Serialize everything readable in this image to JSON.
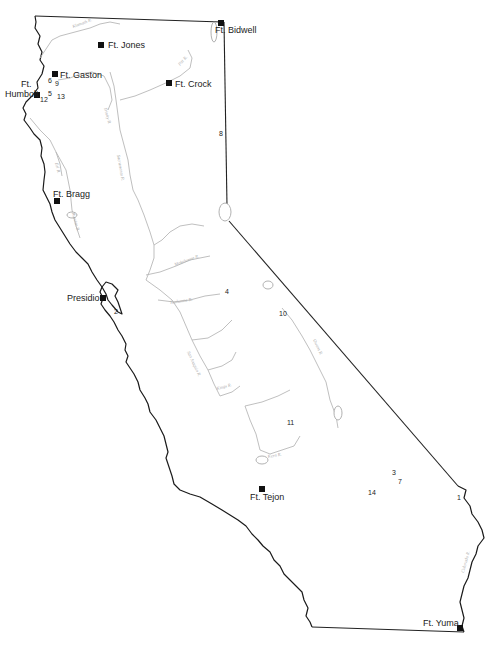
{
  "map": {
    "title": "California forts and sites",
    "colors": {
      "border": "#222222",
      "river": "#b8b8b8",
      "marker": "#111111",
      "background": "#ffffff"
    },
    "forts": [
      {
        "id": "ft-bidwell",
        "label": "Ft. Bidwell",
        "x": 221,
        "y": 23,
        "lx": 215,
        "ly": 33
      },
      {
        "id": "ft-jones",
        "label": "Ft. Jones",
        "x": 101,
        "y": 45,
        "lx": 108,
        "ly": 48
      },
      {
        "id": "ft-gaston",
        "label": "Ft. Gaston",
        "x": 55,
        "y": 74,
        "lx": 60,
        "ly": 78
      },
      {
        "id": "ft-crock",
        "label": "Ft. Crock",
        "x": 169,
        "y": 83,
        "lx": 175,
        "ly": 87
      },
      {
        "id": "ft-humbolt",
        "label_line1": "Ft.",
        "label_line2": "Humbolt",
        "x": 37,
        "y": 95,
        "lx": 5,
        "ly": 87
      },
      {
        "id": "ft-bragg",
        "label": "Ft. Bragg",
        "x": 57,
        "y": 201,
        "lx": 53,
        "ly": 197
      },
      {
        "id": "presidio",
        "label": "Presidio",
        "x": 103,
        "y": 298,
        "lx": 67,
        "ly": 301
      },
      {
        "id": "ft-tejon",
        "label": "Ft. Tejon",
        "x": 262,
        "y": 489,
        "lx": 250,
        "ly": 500
      },
      {
        "id": "ft-yuma",
        "label": "Ft. Yuma",
        "x": 460,
        "y": 628,
        "lx": 423,
        "ly": 626
      }
    ],
    "sites": [
      {
        "n": "1",
        "x": 457,
        "y": 500
      },
      {
        "n": "2",
        "x": 114,
        "y": 314
      },
      {
        "n": "3",
        "x": 392,
        "y": 475
      },
      {
        "n": "4",
        "x": 225,
        "y": 294
      },
      {
        "n": "5",
        "x": 48,
        "y": 96
      },
      {
        "n": "6",
        "x": 48,
        "y": 83
      },
      {
        "n": "7",
        "x": 398,
        "y": 484
      },
      {
        "n": "8",
        "x": 219,
        "y": 136
      },
      {
        "n": "9",
        "x": 55,
        "y": 86
      },
      {
        "n": "10",
        "x": 279,
        "y": 316
      },
      {
        "n": "11",
        "x": 287,
        "y": 425
      },
      {
        "n": "12",
        "x": 40,
        "y": 102
      },
      {
        "n": "13",
        "x": 57,
        "y": 99
      },
      {
        "n": "14",
        "x": 368,
        "y": 495
      }
    ],
    "rivers": [
      {
        "label": "Klamath R.",
        "x": 73,
        "y": 28,
        "rot": -20
      },
      {
        "label": "Pitt R.",
        "x": 180,
        "y": 66,
        "rot": -50
      },
      {
        "label": "Trinity R.",
        "x": 104,
        "y": 108,
        "rot": 75
      },
      {
        "label": "Eel R.",
        "x": 55,
        "y": 163,
        "rot": 75
      },
      {
        "label": "Russian R.",
        "x": 72,
        "y": 213,
        "rot": 75
      },
      {
        "label": "Sacramento R.",
        "x": 117,
        "y": 155,
        "rot": 80
      },
      {
        "label": "Mokelumne R.",
        "x": 175,
        "y": 266,
        "rot": -20
      },
      {
        "label": "Tuolumne R.",
        "x": 170,
        "y": 304,
        "rot": -8
      },
      {
        "label": "San Joaquin R.",
        "x": 187,
        "y": 352,
        "rot": 65
      },
      {
        "label": "Kings R.",
        "x": 217,
        "y": 390,
        "rot": -15
      },
      {
        "label": "Owens R.",
        "x": 313,
        "y": 340,
        "rot": 65
      },
      {
        "label": "Kern R.",
        "x": 268,
        "y": 458,
        "rot": -10
      },
      {
        "label": "Colorado R.",
        "x": 464,
        "y": 573,
        "rot": -75
      }
    ]
  }
}
